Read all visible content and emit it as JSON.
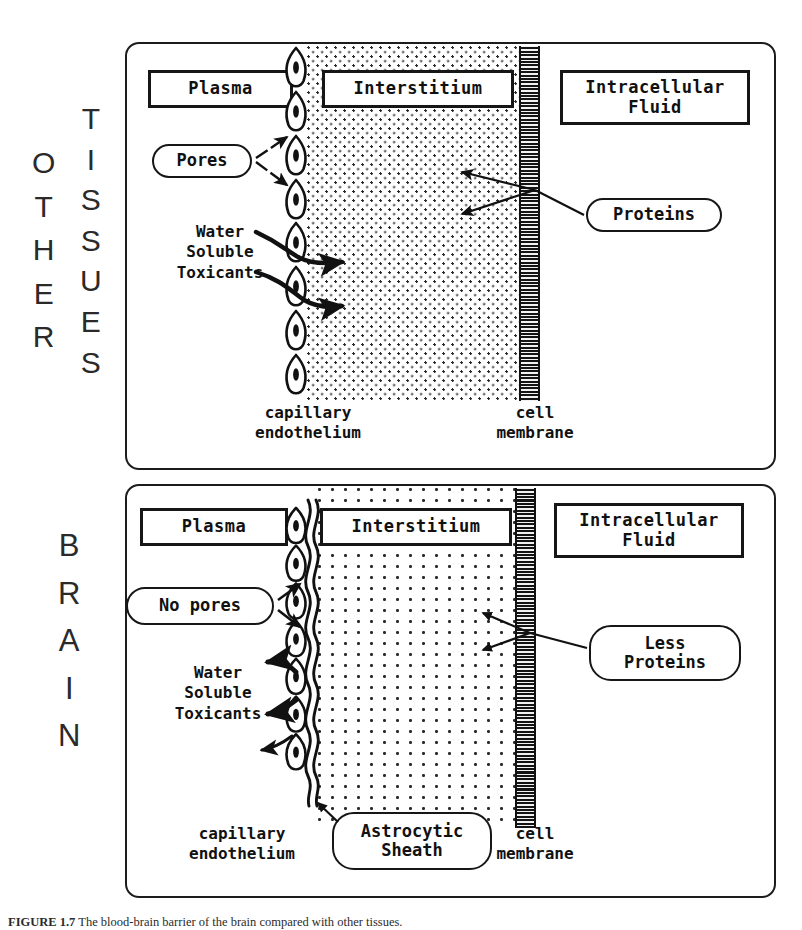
{
  "figure": {
    "caption_label": "FIGURE 1.7",
    "caption_text": "The blood-brain barrier of the brain compared with other tissues."
  },
  "panels": {
    "other": {
      "side_title_primary": "OTHER",
      "side_title_secondary": "TISSUES",
      "regions": {
        "plasma": "Plasma",
        "interstitium": "Interstitium",
        "intracellular_fluid": "Intracellular\nFluid"
      },
      "callouts": {
        "pores": "Pores",
        "proteins": "Proteins"
      },
      "labels": {
        "water_soluble_toxicants": "Water\nSoluble\nToxicants",
        "capillary_endothelium": "capillary\nendothelium",
        "cell_membrane": "cell\nmembrane"
      }
    },
    "brain": {
      "side_title_primary": "BRAIN",
      "regions": {
        "plasma": "Plasma",
        "interstitium": "Interstitium",
        "intracellular_fluid": "Intracellular\nFluid"
      },
      "callouts": {
        "no_pores": "No pores",
        "less_proteins": "Less\nProteins",
        "astrocytic_sheath": "Astrocytic\nSheath"
      },
      "labels": {
        "water_soluble_toxicants": "Water\nSoluble\nToxicants",
        "capillary_endothelium": "capillary\nendothelium",
        "cell_membrane": "cell\nmembrane"
      }
    }
  },
  "colors": {
    "ink": "#161616",
    "paper": "#ffffff",
    "membrane": "#1a1a1a"
  },
  "icons": {
    "endothelial_cell": "endothelial-cell-icon",
    "arrow": "arrow-icon",
    "astrocytic_sheath": "wavy-sheath-icon"
  }
}
